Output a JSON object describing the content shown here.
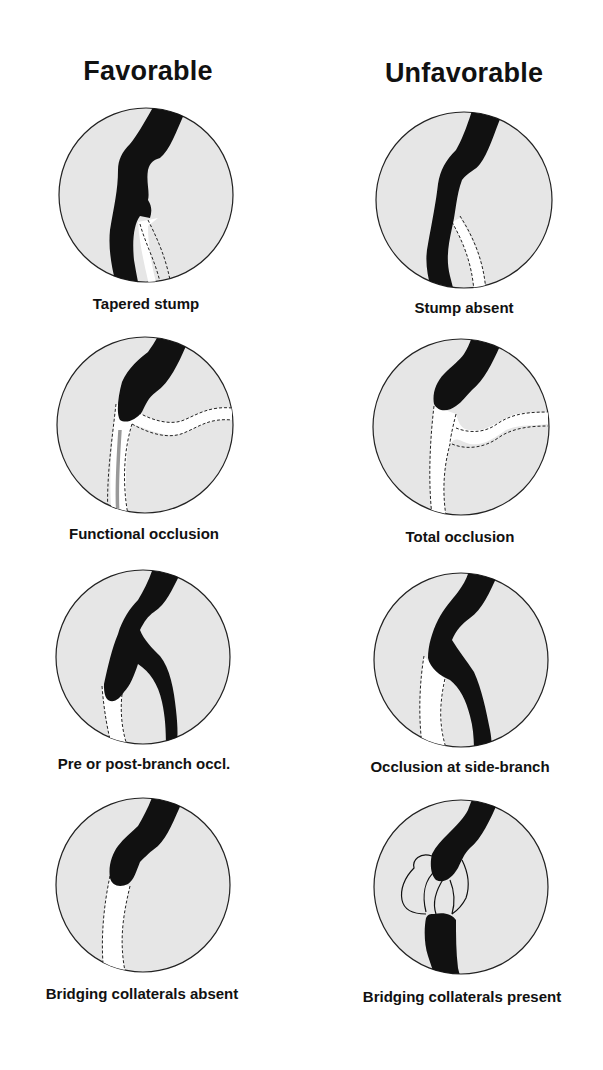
{
  "columns": [
    {
      "title": "Favorable"
    },
    {
      "title": "Unfavorable"
    }
  ],
  "panels": [
    {
      "column": "Favorable",
      "label": "Tapered stump",
      "icon": "vessel-tapered-stump-icon"
    },
    {
      "column": "Unfavorable",
      "label": "Stump absent",
      "icon": "vessel-stump-absent-icon"
    },
    {
      "column": "Favorable",
      "label": "Functional occlusion",
      "icon": "vessel-functional-occlusion-icon"
    },
    {
      "column": "Unfavorable",
      "label": "Total occlusion",
      "icon": "vessel-total-occlusion-icon"
    },
    {
      "column": "Favorable",
      "label": "Pre or post-branch occl.",
      "icon": "vessel-branch-occlusion-icon"
    },
    {
      "column": "Unfavorable",
      "label": "Occlusion at side-branch",
      "icon": "vessel-side-branch-occlusion-icon"
    },
    {
      "column": "Favorable",
      "label": "Bridging collaterals absent",
      "icon": "vessel-no-collaterals-icon"
    },
    {
      "column": "Unfavorable",
      "label": "Bridging collaterals present",
      "icon": "vessel-bridging-collaterals-icon"
    }
  ],
  "colors": {
    "circle_fill": "#e6e6e6",
    "vessel": "#111111",
    "occluded_lumen": "#ffffff",
    "faint_channel": "#9a9a9a"
  }
}
